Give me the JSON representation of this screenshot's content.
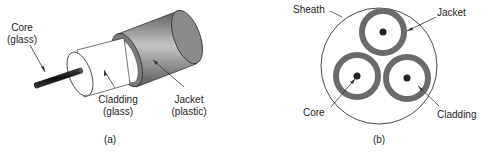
{
  "figure_a": {
    "caption": "(a)",
    "labels": {
      "core_line1": "Core",
      "core_line2": "(glass)",
      "cladding_line1": "Cladding",
      "cladding_line2": "(glass)",
      "jacket_line1": "Jacket",
      "jacket_line2": "(plastic)"
    }
  },
  "figure_b": {
    "caption": "(b)",
    "labels": {
      "sheath": "Sheath",
      "jacket": "Jacket",
      "core": "Core",
      "cladding": "Cladding"
    }
  },
  "colors": {
    "jacket_dark": "#5a5a5a",
    "jacket_light": "#bdbdbd",
    "core": "#222222",
    "ring": "#6b6b6b",
    "line": "#333333"
  }
}
